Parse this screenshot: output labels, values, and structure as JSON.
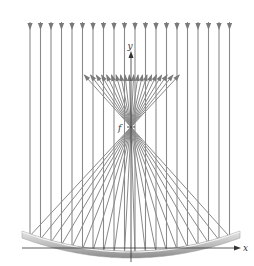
{
  "figure": {
    "labels": {
      "x_axis": "x",
      "y_axis": "y",
      "focus": "f"
    },
    "incident_ray_count": 20,
    "colors": {
      "ray": "#8a8a8a",
      "arrow": "#7a7a7a",
      "mirror_dark": "#8f8f8f",
      "mirror_light": "#d9d9d9",
      "axis": "#333333",
      "background": "#ffffff"
    },
    "geometry": {
      "vertex": [
        131,
        253
      ],
      "focus": [
        131,
        127
      ],
      "mirror_x_range": [
        22,
        240
      ],
      "mirror_edge_y": 233,
      "incident_arrow_y": 26,
      "reflected_end_y": 75,
      "ray_x_start": 30,
      "ray_spacing": 10.5
    }
  }
}
